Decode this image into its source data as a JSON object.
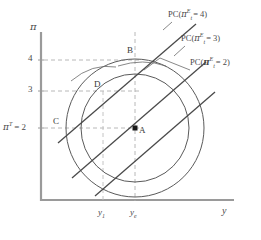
{
  "figure": {
    "type": "economics-phillips-curve-diagram",
    "axes": {
      "y_axis_label": "π",
      "x_axis_label": "y",
      "y_ticks": [
        {
          "value": 4,
          "label": "4",
          "px_y": 60
        },
        {
          "value": 3,
          "label": "3",
          "px_y": 91
        },
        {
          "value": 2,
          "label": "π",
          "label_sup": "T",
          "label_suffix": "= 2",
          "px_y": 128
        }
      ],
      "x_ticks": [
        {
          "label": "y",
          "sub": "1",
          "px_x": 103
        },
        {
          "label": "y",
          "sub": "e",
          "px_x": 135
        }
      ]
    },
    "curve_labels": [
      {
        "id": "pc4",
        "prefix": "PC(",
        "pi": "π",
        "sup": "E",
        "sub": "t",
        "eq": "= 4)",
        "x": 170,
        "y": 14
      },
      {
        "id": "pc3",
        "prefix": "PC(",
        "pi": "π",
        "sup": "E",
        "sub": "t",
        "eq": "= 3)",
        "x": 183,
        "y": 38
      },
      {
        "id": "pc2",
        "prefix": "PC(",
        "pi": "π",
        "sup": "E",
        "sub": "t",
        "eq": "= 2)",
        "x": 192,
        "y": 62
      }
    ],
    "points": [
      {
        "id": "A",
        "label": "A",
        "x": 135,
        "y": 128,
        "marker": "filled-square",
        "meaning": "equilibrium y_e, pi = 2"
      },
      {
        "id": "B",
        "label": "B",
        "x": 135,
        "y": 60,
        "marker": "none",
        "meaning": "y_e, pi = 4"
      },
      {
        "id": "C",
        "label": "C",
        "x": 62,
        "y": 128,
        "marker": "none",
        "meaning": "low output, pi = 2"
      },
      {
        "id": "D",
        "label": "D",
        "x": 103,
        "y": 91,
        "marker": "none",
        "meaning": "y_1, pi = 3"
      }
    ],
    "indifference_circles": [
      {
        "id": "outer",
        "cx": 135,
        "cy": 128,
        "r": 69
      },
      {
        "id": "inner",
        "cx": 135,
        "cy": 128,
        "r": 54
      }
    ],
    "phillips_curves": [
      {
        "id": "pc4",
        "x1": 58,
        "y1": 143,
        "x2": 194,
        "y2": 26
      },
      {
        "id": "pc3",
        "x1": 72,
        "y1": 178,
        "x2": 204,
        "y2": 63
      },
      {
        "id": "pc2",
        "x1": 95,
        "y1": 195,
        "x2": 213,
        "y2": 92
      }
    ]
  }
}
